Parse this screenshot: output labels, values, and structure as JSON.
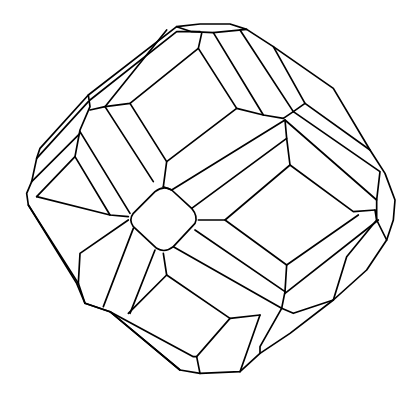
{
  "figure": {
    "title": "Polyhedron crystal line drawing",
    "stroke_color": "#000000",
    "background": "#ffffff"
  }
}
